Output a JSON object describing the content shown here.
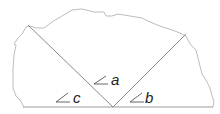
{
  "diagram": {
    "colors": {
      "outline": "#bdbdbd",
      "lines": "#8a8a8a",
      "text": "#222222"
    },
    "labels": [
      {
        "id": "a",
        "text": "a",
        "x": 111,
        "y": 85,
        "angle_x": 93,
        "angle_y": 83
      },
      {
        "id": "b",
        "text": "b",
        "x": 145,
        "y": 103,
        "angle_x": 128,
        "angle_y": 101
      },
      {
        "id": "c",
        "text": "c",
        "x": 73,
        "y": 103,
        "angle_x": 55,
        "angle_y": 101
      }
    ]
  }
}
